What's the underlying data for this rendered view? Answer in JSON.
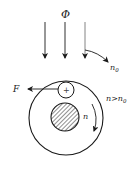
{
  "diagram": {
    "flux_label": "Φ",
    "n0_label": "n",
    "n0_sub": "0",
    "force_label": "F",
    "rotation_label": "n",
    "condition_label_main": "n>n",
    "condition_label_sub": "0",
    "conductor_symbol": "+",
    "colors": {
      "stroke": "#1a1a1a",
      "hatch": "#333333",
      "flux_arrow_light": "#777777"
    }
  }
}
